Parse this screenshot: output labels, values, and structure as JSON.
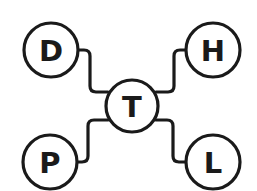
{
  "diagram": {
    "type": "hub-and-spoke",
    "center": {
      "label": "T"
    },
    "nodes": [
      {
        "id": "top-left",
        "label": "D"
      },
      {
        "id": "top-right",
        "label": "H"
      },
      {
        "id": "bottom-left",
        "label": "P"
      },
      {
        "id": "bottom-right",
        "label": "L"
      }
    ],
    "edges": [
      {
        "from": "D",
        "to": "T"
      },
      {
        "from": "H",
        "to": "T"
      },
      {
        "from": "P",
        "to": "T"
      },
      {
        "from": "L",
        "to": "T"
      }
    ],
    "colors": {
      "stroke": "#1a1a1a",
      "background": "#ffffff"
    }
  }
}
